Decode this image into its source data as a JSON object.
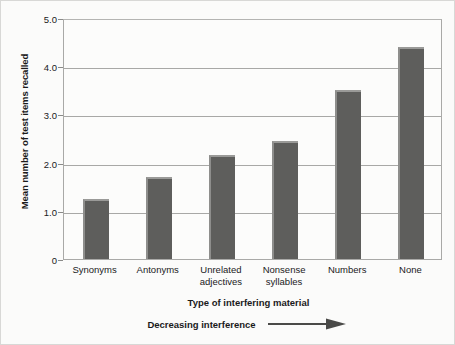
{
  "chart_data": {
    "type": "bar",
    "title": "",
    "subtitle": "",
    "categories": [
      "Synonyms",
      "Antonyms",
      "Unrelated\nadjectives",
      "Nonsense\nsyllables",
      "Numbers",
      "None"
    ],
    "values": [
      1.25,
      1.7,
      2.15,
      2.45,
      3.5,
      4.4
    ],
    "xlabel": "Type of interfering material",
    "ylabel": "Mean number of test items recalled",
    "ylim": [
      0,
      5
    ],
    "ytick_labels": [
      "0",
      "1.0",
      "2.0",
      "3.0",
      "4.0",
      "5.0"
    ],
    "ytick_values": [
      0,
      1,
      2,
      3,
      4,
      5
    ],
    "gridlines": [
      1,
      2,
      3,
      4
    ],
    "grid": true,
    "legend": "none",
    "annotation": "Decreasing interference",
    "annotation_icon": "right-arrow-icon",
    "bar_color": "#5e5e5c",
    "bar_highlight_color": "#9a9a98",
    "grid_color": "#a8a8a6",
    "axis_color": "#a9a9a7",
    "text_color": "#1a1a1a",
    "background_color": "#fbfbfa"
  }
}
